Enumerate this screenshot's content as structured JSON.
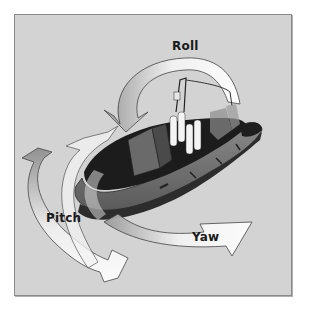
{
  "figure": {
    "background_color": "#d3d3d3",
    "border_color": "#8a8a8a",
    "labels": {
      "roll": "Roll",
      "pitch": "Pitch",
      "yaw": "Yaw"
    },
    "arrows": [
      {
        "name": "roll-arrow",
        "label": "Roll",
        "direction": "arc over boat, pointing down-left"
      },
      {
        "name": "pitch-arrow",
        "label": "Pitch",
        "direction": "vertical loop at bow, pointing up"
      },
      {
        "name": "yaw-arrow",
        "label": "Yaw",
        "direction": "horizontal sweep under boat, pointing right"
      }
    ]
  }
}
